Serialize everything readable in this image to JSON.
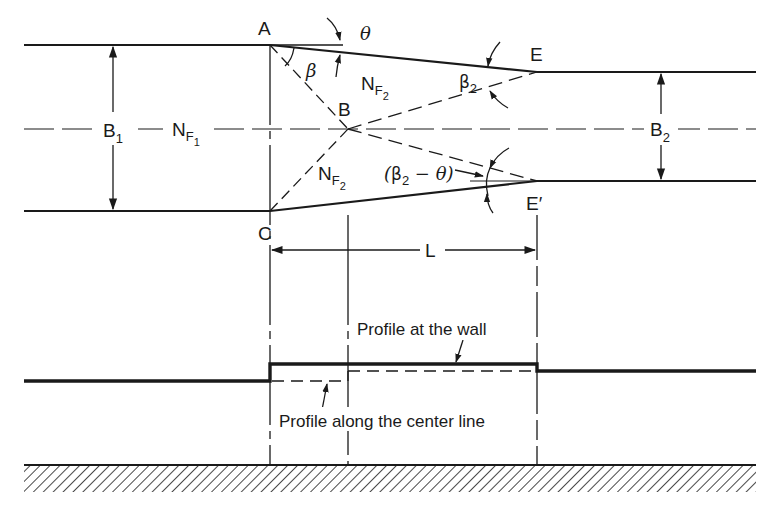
{
  "figure": {
    "points": {
      "A": "A",
      "B": "B",
      "C": "C",
      "E": "E",
      "E_prime": "E′"
    },
    "angles": {
      "theta": "θ",
      "beta": "β",
      "beta2_base": "β",
      "beta2_sub": "2",
      "beta2_minus_theta_open": "(",
      "beta2_minus_theta_beta": "β",
      "beta2_minus_theta_sub": "2",
      "beta2_minus_theta_rest": " − θ",
      "beta2_minus_theta_close": ")"
    },
    "dimensions": {
      "B1_base": "B",
      "B1_sub": "1",
      "B2_base": "B",
      "B2_sub": "2",
      "L": "L"
    },
    "froude": {
      "NF1_base": "N",
      "NF1_sub": "F",
      "NF1_subsub": "1",
      "NF2_base": "N",
      "NF2_sub": "F",
      "NF2_subsub": "2"
    },
    "profiles": {
      "wall": "Profile at the wall",
      "centerline": "Profile along the center line"
    },
    "colors": {
      "ink": "#1a1a1a",
      "background": "#ffffff"
    }
  }
}
